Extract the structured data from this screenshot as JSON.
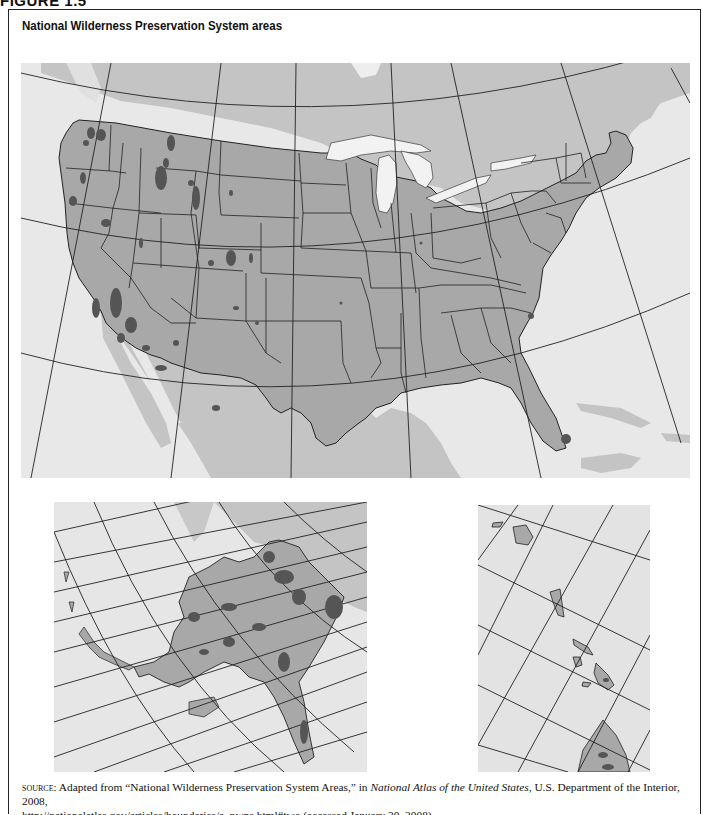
{
  "figure": {
    "label": "FIGURE 1.5",
    "title": "National Wilderness Preservation System areas"
  },
  "colors": {
    "ocean": "#e8e8e8",
    "neighbor_land": "#c4c4c4",
    "us_land": "#a8a8a8",
    "wilderness": "#555555",
    "borders": "#222222",
    "lakes": "#f2f2f2"
  },
  "maps": {
    "main": {
      "name": "Contiguous United States"
    },
    "alaska": {
      "name": "Alaska inset"
    },
    "hawaii": {
      "name": "Hawaii inset"
    }
  },
  "legend": {
    "wilderness_label": "Wilderness areas (dark shading)"
  },
  "source": {
    "prefix": "source:",
    "text_1": " Adapted from “National Wilderness Preservation System Areas,” in ",
    "publication": "National Atlas of the United States",
    "text_2": ", U.S. Department of the Interior, 2008,",
    "url_line": "http://nationalatlas.gov/articles/boundaries/a_nwps.html#two (accessed January 30, 2008)"
  }
}
